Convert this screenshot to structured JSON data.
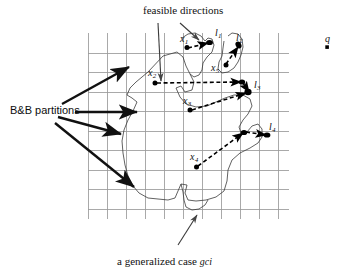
{
  "figure": {
    "width": 353,
    "height": 279,
    "background": "#ffffff",
    "grid_color": "#9a9a9a",
    "region_color": "#3a3a3a",
    "arrow_color": "#111111",
    "point_color": "#000000",
    "annotations": {
      "feasible_directions": "feasible directions",
      "bb_partitions": "B&B partitions",
      "generalized_case_prefix": "a generalized case",
      "generalized_case_symbol": "gc",
      "generalized_case_subscript": "i"
    },
    "points": [
      {
        "name": "x1",
        "base": "x",
        "sub": "1",
        "label_x": 180,
        "label_y": 34,
        "dot_x": 187,
        "dot_y": 47
      },
      {
        "name": "x2",
        "base": "x",
        "sub": "2",
        "label_x": 148,
        "label_y": 68,
        "dot_x": 155,
        "dot_y": 83
      },
      {
        "name": "x3",
        "base": "x",
        "sub": "3",
        "label_x": 183,
        "label_y": 96,
        "dot_x": 190,
        "dot_y": 110
      },
      {
        "name": "x4",
        "base": "x",
        "sub": "4",
        "label_x": 190,
        "label_y": 152,
        "dot_x": 196,
        "dot_y": 167
      },
      {
        "name": "x5",
        "base": "x",
        "sub": "5",
        "label_x": 211,
        "label_y": 63,
        "dot_x": 226,
        "dot_y": 65
      },
      {
        "name": "l1",
        "base": "l",
        "sub": "1",
        "label_x": 215,
        "label_y": 28,
        "dot_x": 211,
        "dot_y": 42
      },
      {
        "name": "l2",
        "base": "l",
        "sub": "2",
        "label_x": 236,
        "label_y": 33,
        "dot_x": 238,
        "dot_y": 45
      },
      {
        "name": "l3",
        "base": "l",
        "sub": "3",
        "label_x": 254,
        "label_y": 80,
        "dot_x": 248,
        "dot_y": 92
      },
      {
        "name": "l4",
        "base": "l",
        "sub": "4",
        "label_x": 269,
        "label_y": 122,
        "dot_x": 268,
        "dot_y": 135
      },
      {
        "name": "q",
        "base": "q",
        "sub": "",
        "label_x": 325,
        "label_y": 34,
        "dot_x": 327,
        "dot_y": 47
      }
    ]
  }
}
